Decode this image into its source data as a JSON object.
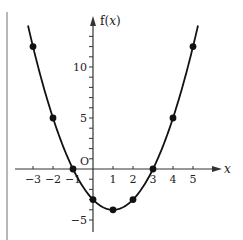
{
  "chart_data": {
    "type": "line",
    "title": "",
    "function": "f(x) = x^2 - 2x - 3",
    "xlabel": "x",
    "ylabel": "f(x)",
    "origin_label": "O",
    "x_ticks": [
      -3,
      -2,
      -1,
      1,
      2,
      3,
      4,
      5
    ],
    "x_tick_labels": [
      "−3",
      "−2",
      "−1",
      "1",
      "2",
      "3",
      "4",
      "5"
    ],
    "y_ticks_labeled": [
      10,
      5,
      -5
    ],
    "y_tick_labels": [
      "10",
      "5",
      "−5"
    ],
    "y_minor_ticks": [
      -5,
      -4,
      -3,
      -2,
      -1,
      1,
      2,
      3,
      4,
      5,
      6,
      7,
      8,
      9,
      10,
      11,
      12,
      13
    ],
    "xlim": [
      -3.5,
      6
    ],
    "ylim": [
      -6,
      14.5
    ],
    "grid": false,
    "legend": null,
    "series": [
      {
        "name": "f(x)",
        "x": [
          -3,
          -2,
          -1,
          0,
          1,
          2,
          3,
          4,
          5
        ],
        "y": [
          12,
          5,
          0,
          -3,
          -4,
          -3,
          0,
          5,
          12
        ],
        "marker": "circle",
        "curve": "smooth parabola"
      }
    ],
    "colors": {
      "line": "#111111",
      "axis": "#333333"
    }
  }
}
